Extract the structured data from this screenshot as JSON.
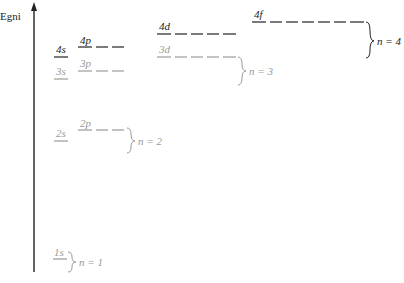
{
  "axis": {
    "label": "Egni"
  },
  "colors": {
    "dark": "#222222",
    "light": "#9a9a9a"
  },
  "orbitals": {
    "s1": {
      "label": "1s"
    },
    "s2": {
      "label": "2s"
    },
    "p2": {
      "label": "2p"
    },
    "s3": {
      "label": "3s"
    },
    "p3": {
      "label": "3p"
    },
    "d3": {
      "label": "3d"
    },
    "s4": {
      "label": "4s"
    },
    "p4": {
      "label": "4p"
    },
    "d4": {
      "label": "4d"
    },
    "f4": {
      "label": "4f"
    }
  },
  "shells": {
    "n1": "n = 1",
    "n2": "n = 2",
    "n3": "n = 3",
    "n4": "n = 4"
  }
}
